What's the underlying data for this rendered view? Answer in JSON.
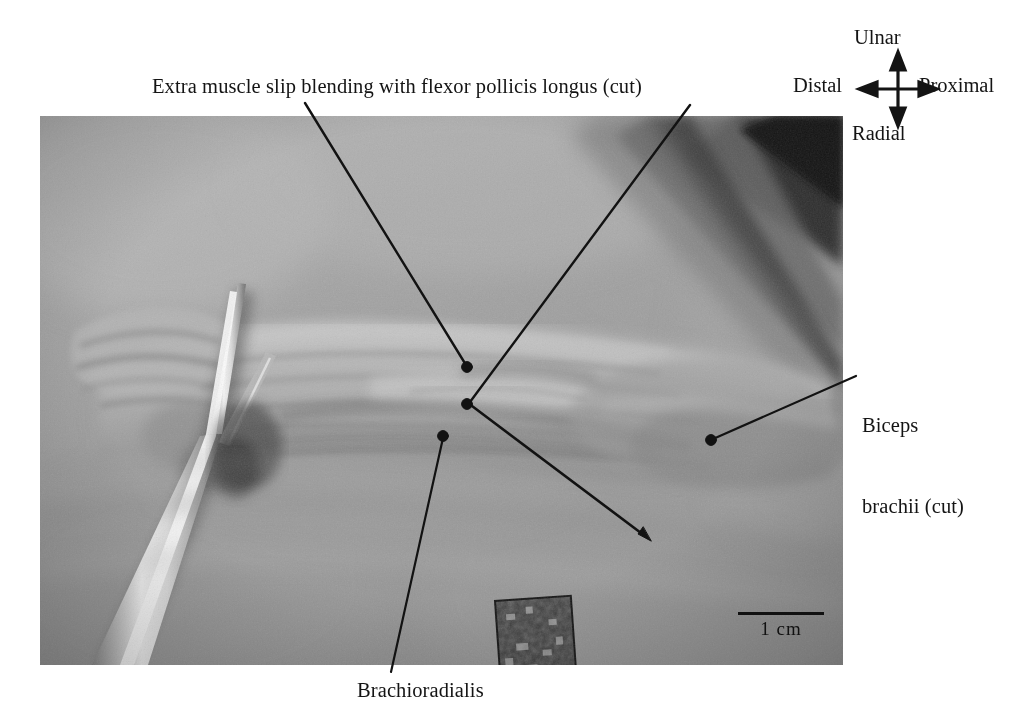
{
  "figure": {
    "type": "anatomical-dissection-photograph",
    "caption_labels": {
      "extra_muscle_slip": "Extra muscle slip blending with flexor pollicis longus (cut)",
      "biceps_line1": "Biceps",
      "biceps_line2": "brachii (cut)",
      "brachioradialis": "Brachioradialis"
    }
  },
  "orientation": {
    "up": "Ulnar",
    "down": "Radial",
    "left": "Distal",
    "right": "Proximal"
  },
  "scale": {
    "label": "1 cm",
    "bar_length_px": 86
  },
  "colors": {
    "text": "#141414",
    "leader_line": "#121212",
    "photo_background": "#9d9d9d",
    "page_background": "#ffffff",
    "scale_bar": "#111111"
  }
}
